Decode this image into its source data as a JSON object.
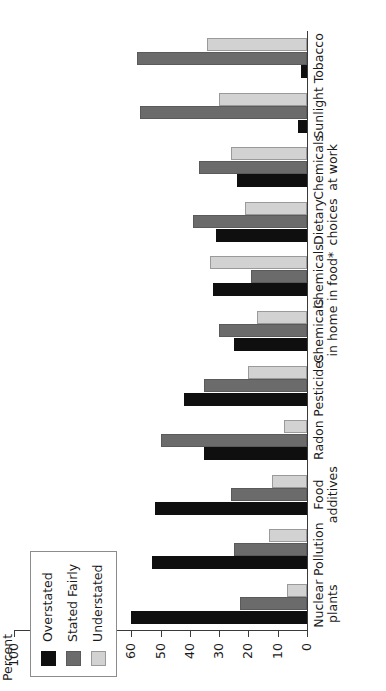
{
  "chart_data": {
    "type": "bar",
    "orientation": "vertical-rendered-rotated",
    "title": "",
    "xlabel": "",
    "ylabel": "Percent",
    "ylim": [
      0,
      100
    ],
    "ytick_labels": [
      "0",
      "10",
      "20",
      "30",
      "40",
      "50",
      "60",
      "70",
      "80",
      "90",
      "100"
    ],
    "ytick_values": [
      0,
      10,
      20,
      30,
      40,
      50,
      60,
      70,
      80,
      90,
      100
    ],
    "grid": false,
    "legend_position": "top-left",
    "categories": [
      "Nuclear\nplants",
      "Pollution",
      "Food\nadditives",
      "Radon",
      "Pesticides",
      "Chemicals\nin home",
      "Chemicals\nin food*",
      "Dietary\nchoices",
      "Chemicals\nat work",
      "Sunlight",
      "Tobacco"
    ],
    "series": [
      {
        "name": "Overstated",
        "color": "#0f0f0f",
        "values": [
          60,
          53,
          52,
          35,
          42,
          25,
          32,
          31,
          24,
          3,
          2
        ]
      },
      {
        "name": "Stated Fairly",
        "color": "#6b6b6b",
        "values": [
          23,
          25,
          26,
          50,
          35,
          30,
          19,
          39,
          37,
          57,
          58
        ]
      },
      {
        "name": "Understated",
        "color": "#d2d2d2",
        "values": [
          7,
          13,
          12,
          8,
          20,
          17,
          33,
          21,
          26,
          30,
          34
        ]
      }
    ],
    "footnote": "*"
  },
  "legend": {
    "items": [
      {
        "label": "Overstated",
        "swatch": "overstated"
      },
      {
        "label": "Stated Fairly",
        "swatch": "fairly"
      },
      {
        "label": "Understated",
        "swatch": "understated"
      }
    ]
  },
  "axis": {
    "percent_title": "Percent"
  }
}
